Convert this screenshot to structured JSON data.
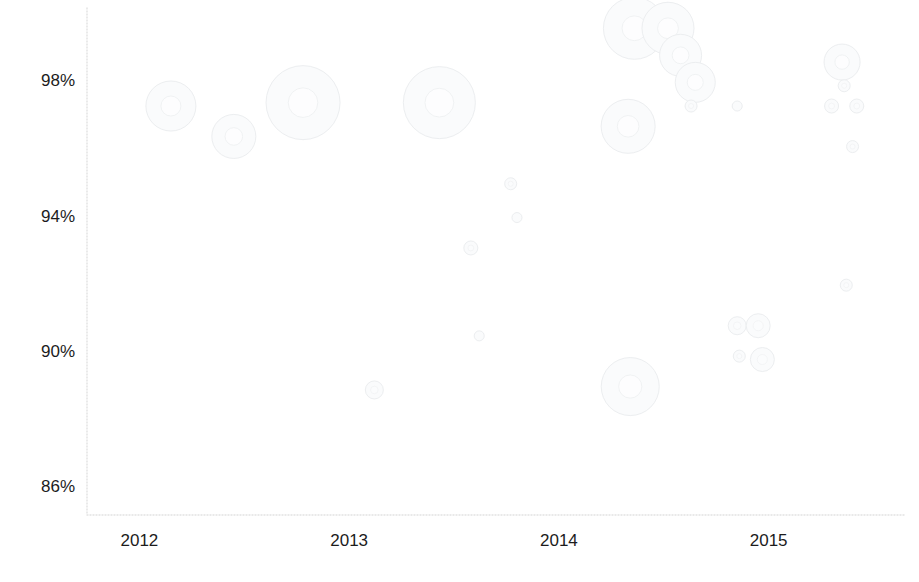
{
  "chart": {
    "title": "",
    "subtitle": ""
  },
  "axes": {
    "x": {
      "label": "",
      "ticks": [
        "2012",
        "2013",
        "2014",
        "2015"
      ],
      "tick_values": [
        2012,
        2013,
        2014,
        2015
      ],
      "range": [
        2011.75,
        2015.65
      ],
      "pixel_left": 87,
      "pixel_right": 905,
      "baseline_y": 515
    },
    "y": {
      "label": "",
      "ticks": [
        "98%",
        "94%",
        "90%",
        "86%"
      ],
      "tick_values": [
        98,
        94,
        90,
        86
      ],
      "range": [
        85.2,
        100.2
      ],
      "pixel_top": 8,
      "pixel_bottom": 515
    }
  },
  "style": {
    "bubble_fill": "#fafbfc",
    "bubble_stroke": "#eceef0",
    "axis_color": "#e2e2e2",
    "text_color": "#1c1c1c",
    "background": "#ffffff"
  },
  "chart_data": {
    "type": "scatter",
    "title": "",
    "xlabel": "",
    "ylabel": "",
    "xlim": [
      2011.75,
      2015.65
    ],
    "ylim": [
      85.2,
      100.2
    ],
    "grid": false,
    "legend": "none",
    "x_tick_labels": [
      "2012",
      "2013",
      "2014",
      "2015"
    ],
    "y_tick_labels": [
      "98%",
      "94%",
      "90%",
      "86%"
    ],
    "note": "Bubble (proportional-symbol) scatter; marker area encodes a third magnitude variable. Values read off the axes; bubble radii given in pixels.",
    "points": [
      {
        "x": 2012.15,
        "y": 97.3,
        "r": 25
      },
      {
        "x": 2012.45,
        "y": 96.4,
        "r": 22
      },
      {
        "x": 2012.78,
        "y": 97.4,
        "r": 37
      },
      {
        "x": 2013.12,
        "y": 88.9,
        "r": 9
      },
      {
        "x": 2013.43,
        "y": 97.4,
        "r": 36
      },
      {
        "x": 2013.58,
        "y": 93.1,
        "r": 7
      },
      {
        "x": 2013.62,
        "y": 90.5,
        "r": 5
      },
      {
        "x": 2013.77,
        "y": 95.0,
        "r": 6
      },
      {
        "x": 2013.8,
        "y": 94.0,
        "r": 5
      },
      {
        "x": 2014.33,
        "y": 96.7,
        "r": 27
      },
      {
        "x": 2014.36,
        "y": 99.6,
        "r": 31
      },
      {
        "x": 2014.52,
        "y": 99.6,
        "r": 26
      },
      {
        "x": 2014.58,
        "y": 98.8,
        "r": 21
      },
      {
        "x": 2014.65,
        "y": 98.0,
        "r": 20
      },
      {
        "x": 2014.63,
        "y": 97.3,
        "r": 6
      },
      {
        "x": 2014.85,
        "y": 97.3,
        "r": 5
      },
      {
        "x": 2014.34,
        "y": 89.0,
        "r": 29
      },
      {
        "x": 2014.85,
        "y": 90.8,
        "r": 9
      },
      {
        "x": 2014.95,
        "y": 90.8,
        "r": 12
      },
      {
        "x": 2014.86,
        "y": 89.9,
        "r": 6
      },
      {
        "x": 2014.97,
        "y": 89.8,
        "r": 12
      },
      {
        "x": 2015.35,
        "y": 98.6,
        "r": 18
      },
      {
        "x": 2015.36,
        "y": 97.9,
        "r": 6
      },
      {
        "x": 2015.3,
        "y": 97.3,
        "r": 7
      },
      {
        "x": 2015.42,
        "y": 97.3,
        "r": 7
      },
      {
        "x": 2015.4,
        "y": 96.1,
        "r": 6
      },
      {
        "x": 2015.37,
        "y": 92.0,
        "r": 6
      }
    ]
  }
}
